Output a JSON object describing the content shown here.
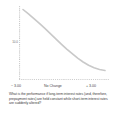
{
  "figure": {
    "background": "#ffffff",
    "caption": "What is the performance if long-term interest rates (and, therefore, prepayment rates) are held constant while short-term interest rates are suddenly altered?"
  },
  "axes": {
    "ylabel": "10.0",
    "xticks": {
      "left": "− 3.00",
      "center": "No Change",
      "right": "+ 3.00"
    },
    "axis_color": "#9a9a9a",
    "axis_style": "dotted"
  },
  "chart_data": {
    "type": "line",
    "title": "",
    "subtitle": "",
    "xlabel": "",
    "ylabel": "10.0",
    "xlim": [
      -3.0,
      3.0
    ],
    "ylim": [
      8.0,
      12.0
    ],
    "grid": false,
    "legend": null,
    "tick_labels": {
      "x": [
        "− 3.00",
        "No Change",
        "+ 3.00"
      ],
      "y": [
        "10.0"
      ]
    },
    "annotations": [],
    "series": [
      {
        "name": "Total return",
        "color": "#c9c9c9",
        "linewidth": 1.6,
        "x": [
          -3.0,
          -2.6,
          -2.2,
          -1.8,
          -1.4,
          -1.0,
          -0.6,
          -0.2,
          0.2,
          0.6,
          1.0,
          1.4,
          1.8,
          2.2,
          2.6,
          3.0
        ],
        "values": [
          11.78,
          11.55,
          11.31,
          11.06,
          10.8,
          10.53,
          10.26,
          9.99,
          9.73,
          9.49,
          9.26,
          9.06,
          8.89,
          8.76,
          8.67,
          8.62
        ]
      }
    ]
  }
}
